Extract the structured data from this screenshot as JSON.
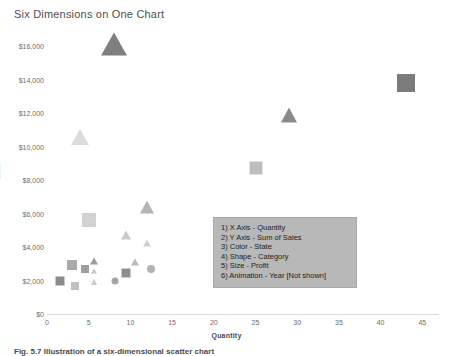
{
  "chart_data": {
    "type": "scatter",
    "title": "Six Dimensions on One Chart",
    "xlabel": "Quantity",
    "ylabel": "Sales",
    "xlim": [
      0,
      47
    ],
    "ylim": [
      0,
      16800
    ],
    "grid": false,
    "legend_position": "inside-center-right",
    "x_ticks": [
      "0",
      "5",
      "10",
      "15",
      "20",
      "25",
      "30",
      "35",
      "40",
      "45"
    ],
    "x_tick_values": [
      0,
      5,
      10,
      15,
      20,
      25,
      30,
      35,
      40,
      45
    ],
    "y_ticks": [
      "$0",
      "$2,000",
      "$4,000",
      "$6,000",
      "$8,000",
      "$10,000",
      "$12,000",
      "$14,000",
      "$16,000"
    ],
    "y_tick_values": [
      0,
      2000,
      4000,
      6000,
      8000,
      10000,
      12000,
      14000,
      16000
    ],
    "encodings": {
      "x": "Quantity",
      "y": "Sum of Sales",
      "color": "State",
      "shape": "Category",
      "size": "Profit",
      "animation": "Year [Not shown]"
    },
    "points": [
      {
        "x": 8.0,
        "y": 16000,
        "shape": "triangle",
        "size": 26,
        "color": "#7f7f7f"
      },
      {
        "x": 43.0,
        "y": 13800,
        "shape": "square",
        "size": 18,
        "color": "#7b7b7b"
      },
      {
        "x": 29.0,
        "y": 11800,
        "shape": "triangle",
        "size": 17,
        "color": "#8a8a8a"
      },
      {
        "x": 4.0,
        "y": 10500,
        "shape": "triangle",
        "size": 18,
        "color": "#dcdcdc"
      },
      {
        "x": 25.0,
        "y": 8700,
        "shape": "square",
        "size": 13,
        "color": "#bdbdbd"
      },
      {
        "x": 12.0,
        "y": 6350,
        "shape": "triangle",
        "size": 15,
        "color": "#b4b4b4"
      },
      {
        "x": 5.0,
        "y": 5600,
        "shape": "square",
        "size": 14,
        "color": "#d2d2d2"
      },
      {
        "x": 9.5,
        "y": 4700,
        "shape": "triangle",
        "size": 10,
        "color": "#c9c9c9"
      },
      {
        "x": 12.0,
        "y": 4200,
        "shape": "triangle",
        "size": 8,
        "color": "#cfcfcf"
      },
      {
        "x": 10.5,
        "y": 3050,
        "shape": "triangle",
        "size": 8,
        "color": "#b9b9b9"
      },
      {
        "x": 12.5,
        "y": 2700,
        "shape": "circle",
        "size": 8,
        "color": "#b2b2b2"
      },
      {
        "x": 3.0,
        "y": 2900,
        "shape": "square",
        "size": 10,
        "color": "#a9a9a9"
      },
      {
        "x": 4.6,
        "y": 2700,
        "shape": "square",
        "size": 8,
        "color": "#9d9d9d"
      },
      {
        "x": 5.6,
        "y": 3150,
        "shape": "triangle",
        "size": 8,
        "color": "#9a9a9a"
      },
      {
        "x": 5.6,
        "y": 2550,
        "shape": "triangle",
        "size": 6,
        "color": "#c4c4c4"
      },
      {
        "x": 9.5,
        "y": 2450,
        "shape": "square",
        "size": 9,
        "color": "#8f8f8f"
      },
      {
        "x": 1.6,
        "y": 1950,
        "shape": "square",
        "size": 9,
        "color": "#8c8c8c"
      },
      {
        "x": 3.4,
        "y": 1700,
        "shape": "square",
        "size": 8,
        "color": "#c0c0c0"
      },
      {
        "x": 5.6,
        "y": 1900,
        "shape": "triangle",
        "size": 7,
        "color": "#cacaca"
      },
      {
        "x": 8.2,
        "y": 2000,
        "shape": "circle",
        "size": 7,
        "color": "#a4a4a4"
      }
    ],
    "legend_lines": [
      "1) X Axis - Quantity",
      "2) Y Axis - Sum of Sales",
      "3) Color - State",
      "4) Shape - Category",
      "5) Size - Profit",
      "6) Animation - Year [Not shown]"
    ]
  },
  "caption": "Fig. 5.7  Illustration of a six-dimensional scatter chart"
}
